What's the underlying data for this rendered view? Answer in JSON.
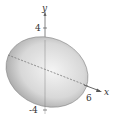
{
  "figure": {
    "type": "3d-ellipsoid",
    "axes": {
      "y_label": "y",
      "x_label": "x",
      "y_tick_top": "4",
      "y_tick_bottom": "-4",
      "x_tick": "6"
    },
    "colors": {
      "surface_light": "#f2f2f2",
      "surface_dark": "#9a9a9a",
      "axis": "#555555"
    }
  }
}
